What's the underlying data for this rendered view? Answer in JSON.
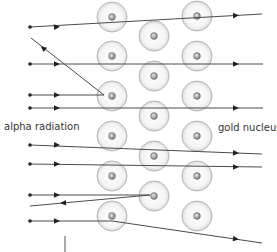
{
  "labels": {
    "alpha": "alpha radiation",
    "gold": "gold nucleus"
  },
  "colors": {
    "line": "#4a4a4a",
    "atom_fill": "#f2f2f2",
    "atom_stroke": "#b5b5b5",
    "nucleus": "#8a8a8a"
  },
  "atoms": [
    {
      "x": 112,
      "y": 17
    },
    {
      "x": 112,
      "y": 56
    },
    {
      "x": 112,
      "y": 96
    },
    {
      "x": 112,
      "y": 136
    },
    {
      "x": 112,
      "y": 176
    },
    {
      "x": 112,
      "y": 216
    },
    {
      "x": 154,
      "y": 36
    },
    {
      "x": 154,
      "y": 76
    },
    {
      "x": 154,
      "y": 116
    },
    {
      "x": 154,
      "y": 156
    },
    {
      "x": 154,
      "y": 196
    },
    {
      "x": 197,
      "y": 16
    },
    {
      "x": 197,
      "y": 56
    },
    {
      "x": 197,
      "y": 96
    },
    {
      "x": 197,
      "y": 136
    },
    {
      "x": 197,
      "y": 176
    },
    {
      "x": 197,
      "y": 216
    }
  ],
  "paths": [
    {
      "points": [
        [
          30,
          27
        ],
        [
          262,
          14
        ]
      ],
      "start_dot": true,
      "arrows": [
        [
          57,
          27
        ],
        [
          236,
          15.5
        ]
      ]
    },
    {
      "points": [
        [
          30,
          64
        ],
        [
          263,
          64
        ]
      ],
      "start_dot": true,
      "arrows": [
        [
          57,
          64
        ],
        [
          236,
          64
        ]
      ]
    },
    {
      "points": [
        [
          30,
          95
        ],
        [
          104,
          95
        ],
        [
          31,
          38
        ]
      ],
      "start_dot": true,
      "arrows": [
        [
          57,
          95
        ],
        [
          43,
          48
        ]
      ],
      "reverse_arrow_index": 1
    },
    {
      "points": [
        [
          30,
          108
        ],
        [
          263,
          108
        ]
      ],
      "start_dot": true,
      "arrows": [
        [
          57,
          108
        ],
        [
          236,
          108
        ]
      ]
    },
    {
      "points": [
        [
          30,
          145
        ],
        [
          262,
          154
        ]
      ],
      "start_dot": true,
      "arrows": [
        [
          57,
          145
        ],
        [
          236,
          153
        ]
      ]
    },
    {
      "points": [
        [
          30,
          164
        ],
        [
          262,
          167
        ]
      ],
      "start_dot": true,
      "arrows": [
        [
          57,
          164
        ],
        [
          236,
          167
        ]
      ]
    },
    {
      "points": [
        [
          30,
          195
        ],
        [
          150,
          195
        ],
        [
          30,
          206
        ]
      ],
      "start_dot": true,
      "arrows": [
        [
          57,
          195
        ],
        [
          63,
          203
        ]
      ],
      "reverse_arrow_index": 1
    },
    {
      "points": [
        [
          30,
          221
        ],
        [
          112,
          221
        ],
        [
          262,
          243
        ]
      ],
      "start_dot": true,
      "arrows": [
        [
          57,
          221
        ],
        [
          236,
          239
        ]
      ]
    }
  ],
  "axis_tick": {
    "x": 65,
    "y1": 236,
    "y2": 252
  }
}
